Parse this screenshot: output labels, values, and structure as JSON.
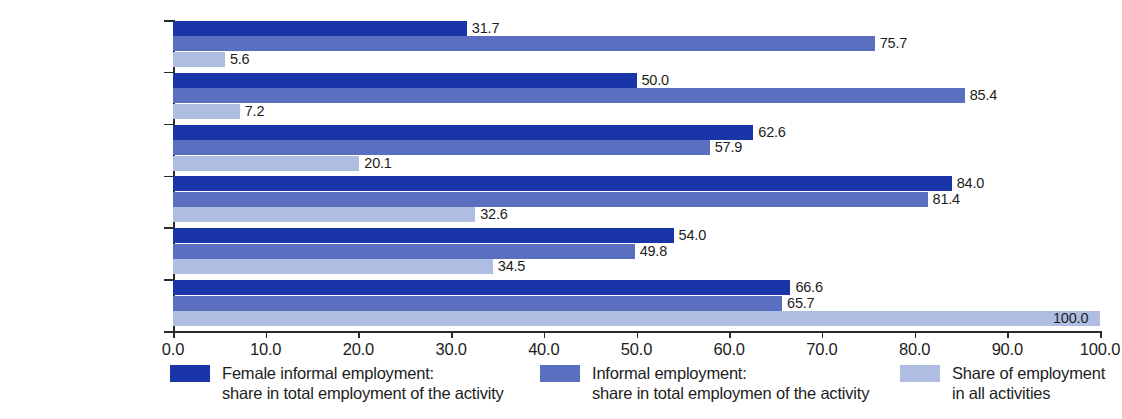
{
  "chart_data": {
    "type": "bar",
    "orientation": "horizontal",
    "title": "",
    "xlabel": "",
    "ylabel": "",
    "xlim": [
      0.0,
      100.0
    ],
    "xticks": [
      "0.0",
      "10.0",
      "20.0",
      "30.0",
      "40.0",
      "50.0",
      "60.0",
      "70.0",
      "80.0",
      "90.0",
      "100.0"
    ],
    "grid": false,
    "legend_position": "bottom",
    "categories": [
      "Transportation",
      "Construction",
      "Manufacturing",
      "Trade",
      "Services other than trade\nor transportation",
      "All non-agricultural\nactivities"
    ],
    "series": [
      {
        "name": "Female informal employment:\nshare in total employment of the activity",
        "color": "#1a35a8",
        "values": [
          31.7,
          50.0,
          62.6,
          84.0,
          54.0,
          66.6
        ],
        "labels": [
          "31.7",
          "50.0",
          "62.6",
          "84.0",
          "54.0",
          "66.6"
        ]
      },
      {
        "name": "Informal employment:\nshare in total employmen of the activity",
        "color": "#5b6fc0",
        "values": [
          75.7,
          85.4,
          57.9,
          81.4,
          49.8,
          65.7
        ],
        "labels": [
          "75.7",
          "85.4",
          "57.9",
          "81.4",
          "49.8",
          "65.7"
        ]
      },
      {
        "name": "Share of employment\nin all activities",
        "color": "#b0bde3",
        "values": [
          5.6,
          7.2,
          20.1,
          32.6,
          34.5,
          100.0
        ],
        "labels": [
          "5.6",
          "7.2",
          "20.1",
          "32.6",
          "34.5",
          "100.0"
        ]
      }
    ]
  },
  "legend": {
    "items": [
      {
        "label": "Female informal employment:\nshare in total employment of the activity",
        "color": "#1a35a8",
        "swatch_name": "legend-swatch-female-informal"
      },
      {
        "label": "Informal employment:\nshare in total employmen of the activity",
        "color": "#5b6fc0",
        "swatch_name": "legend-swatch-informal"
      },
      {
        "label": "Share of employment\nin all activities",
        "color": "#b0bde3",
        "swatch_name": "legend-swatch-share-all"
      }
    ]
  }
}
